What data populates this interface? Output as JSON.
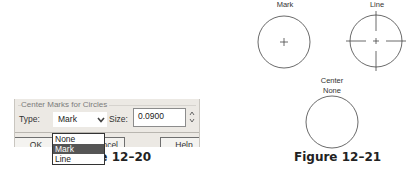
{
  "figure_12_20": {
    "caption": "Figure 12–20",
    "dialog": {
      "group_title": "Center Marks for Circles",
      "type_label": "Type:",
      "type_value": "Mark",
      "size_label": "Size:",
      "size_value": "0.0900",
      "dropdown_options": [
        "None",
        "Mark",
        "Line"
      ],
      "selected_option": "Mark",
      "buttons": {
        "ok": "OK",
        "cancel": "Cancel",
        "cancel_visible": "ncel",
        "help": "Help"
      },
      "icons": {
        "combo_arrow": "chevron-down-icon",
        "spinner": "spinner-up-down-icon"
      }
    }
  },
  "figure_12_21": {
    "caption": "Figure 12–21",
    "examples": [
      {
        "label": "Mark",
        "style": "mark"
      },
      {
        "label": "Line",
        "style": "line"
      },
      {
        "label_line1": "Center",
        "label_line2": "None",
        "style": "none"
      }
    ]
  }
}
